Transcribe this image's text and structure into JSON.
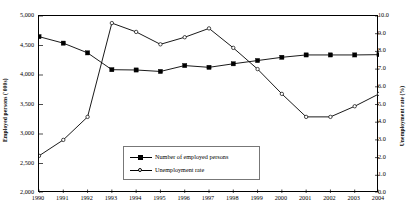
{
  "chart_data": {
    "type": "line",
    "title": "",
    "xlabel": "",
    "ylabel": "Employed persons ('000s)",
    "y2label": "Unemployment rate (%)",
    "grid": false,
    "legend_position": "inside-bottom-center",
    "categories": [
      "1990",
      "1991",
      "1992",
      "1993",
      "1994",
      "1995",
      "1996",
      "1997",
      "1998",
      "1999",
      "2000",
      "2001",
      "2002",
      "2003",
      "2004"
    ],
    "ylim": [
      2000,
      5000
    ],
    "ytick_labels": [
      "2,000",
      "2,500",
      "3,000",
      "3,500",
      "4,000",
      "4,500",
      "5,000"
    ],
    "ytick_values": [
      2000,
      2500,
      3000,
      3500,
      4000,
      4500,
      5000
    ],
    "y2lim": [
      0.0,
      10.0
    ],
    "y2tick_labels": [
      "0.0",
      "1.0",
      "2.0",
      "3.0",
      "4.0",
      "5.0",
      "6.0",
      "7.0",
      "8.0",
      "9.0",
      "10.0"
    ],
    "y2tick_values": [
      0,
      1,
      2,
      3,
      4,
      5,
      6,
      7,
      8,
      9,
      10
    ],
    "series": [
      {
        "name": "Number of employed persons",
        "axis": "left",
        "marker": "filled-square",
        "color": "#000000",
        "values": [
          4650,
          4540,
          4375,
          4090,
          4085,
          4060,
          4160,
          4130,
          4190,
          4245,
          4300,
          4340,
          4340,
          4340,
          4345
        ]
      },
      {
        "name": "Unemployment rate",
        "axis": "right",
        "marker": "open-circle",
        "color": "#000000",
        "values": [
          2.1,
          3.0,
          4.3,
          9.6,
          9.1,
          8.4,
          8.8,
          9.3,
          8.2,
          7.0,
          5.6,
          4.3,
          4.3,
          4.9,
          5.6
        ]
      }
    ]
  },
  "legend": {
    "items": [
      {
        "label": "Number of employed persons",
        "marker": "filled-square"
      },
      {
        "label": "Unemployment rate",
        "marker": "open-circle"
      }
    ]
  }
}
